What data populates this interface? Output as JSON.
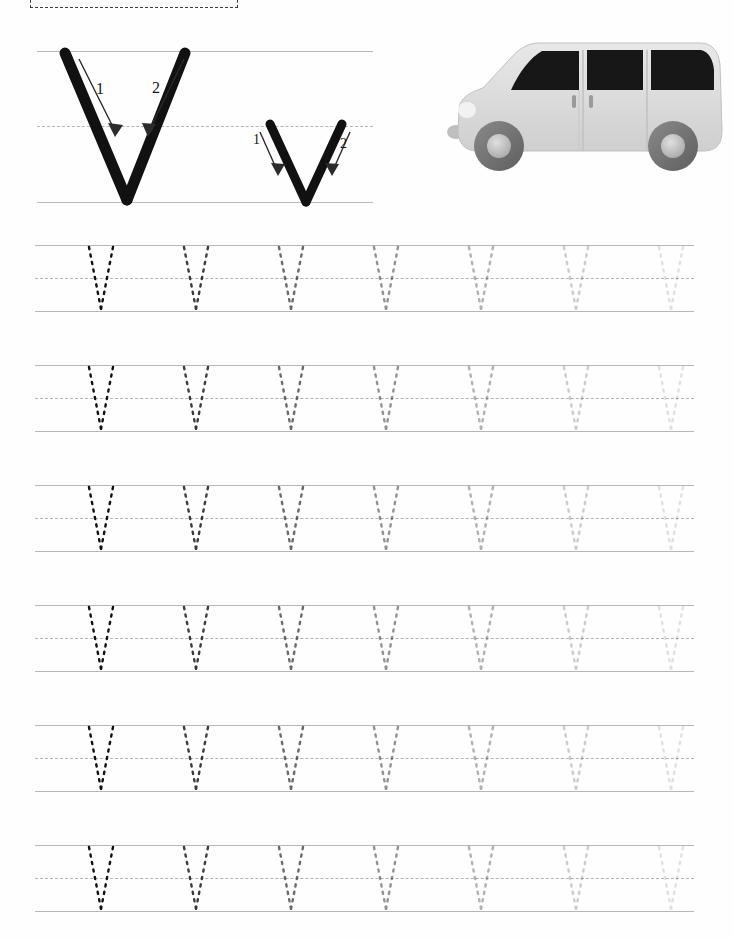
{
  "worksheet": {
    "letter_upper": "V",
    "letter_lower": "v",
    "title_hidden": "",
    "name_box_label": "",
    "page_background": "#fefefe",
    "line_color_solid": "#b7b7b7",
    "line_color_dashed": "#b2b2b2",
    "letter_color": "#111111"
  },
  "demo": {
    "uppercase": {
      "glyph": "V",
      "stroke_labels": [
        "1",
        "2"
      ],
      "stroke_count": 2,
      "arrow_icons": [
        "stroke-arrow-1-icon",
        "stroke-arrow-2-icon"
      ]
    },
    "lowercase": {
      "glyph": "v",
      "stroke_labels": [
        "1",
        "2"
      ],
      "stroke_count": 2,
      "arrow_icons": [
        "stroke-arrow-1-icon",
        "stroke-arrow-2-icon"
      ]
    },
    "guides": {
      "top_line": "solid",
      "middle_line": "dashed",
      "baseline": "solid"
    }
  },
  "illustration": {
    "name": "van-illustration",
    "subject": "van",
    "body_color": "#d8d8d8",
    "window_color": "#171717",
    "tire_color": "#6f6f6f",
    "hub_color": "#c4c4c4"
  },
  "practice": {
    "row_count": 6,
    "letters_per_row": 7,
    "trace_glyph": "v",
    "fade_opacities": [
      1.0,
      0.82,
      0.62,
      0.45,
      0.32,
      0.2,
      0.12
    ],
    "rows": [
      {
        "index": 1,
        "top": 245
      },
      {
        "index": 2,
        "top": 365
      },
      {
        "index": 3,
        "top": 485
      },
      {
        "index": 4,
        "top": 605
      },
      {
        "index": 5,
        "top": 725
      },
      {
        "index": 6,
        "top": 845
      }
    ],
    "letter_x_positions": [
      86,
      181,
      276,
      371,
      466,
      561,
      656
    ]
  }
}
